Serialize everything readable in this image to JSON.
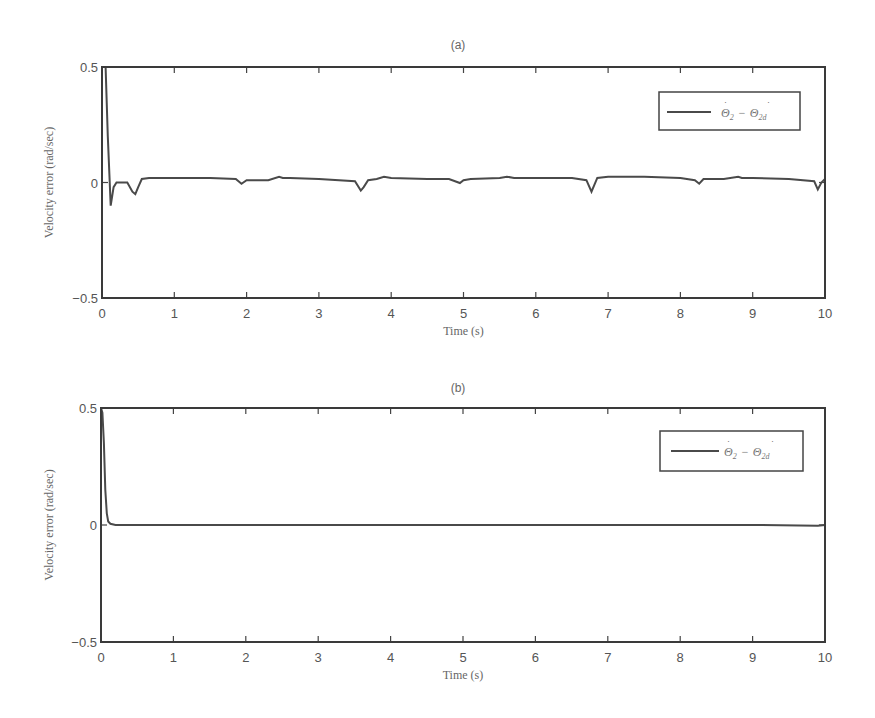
{
  "chart_data": [
    {
      "type": "line",
      "title": "(a)",
      "xlabel": "Time (s)",
      "ylabel": "Velocity error (rad/sec)",
      "xlim": [
        0,
        10
      ],
      "ylim": [
        -0.5,
        0.5
      ],
      "xticks": [
        "0",
        "1",
        "2",
        "3",
        "4",
        "5",
        "6",
        "7",
        "8",
        "9",
        "10"
      ],
      "yticks": [
        "0.5",
        "0",
        "-0.5"
      ],
      "grid": false,
      "legend": {
        "position": "upper right",
        "entries": [
          "Θ̇2 − Θ̇2d"
        ]
      },
      "series": [
        {
          "name": "Θ̇2 − Θ̇2d",
          "x": [
            0,
            0.02,
            0.05,
            0.08,
            0.12,
            0.16,
            0.2,
            0.25,
            0.35,
            0.42,
            0.46,
            0.5,
            0.55,
            0.65,
            1.0,
            1.5,
            1.85,
            1.93,
            2.0,
            2.3,
            2.45,
            2.5,
            2.6,
            3.0,
            3.5,
            3.58,
            3.62,
            3.68,
            3.8,
            3.9,
            4.0,
            4.5,
            4.8,
            4.95,
            5.0,
            5.1,
            5.5,
            5.6,
            5.7,
            6.0,
            6.5,
            6.7,
            6.77,
            6.85,
            7.0,
            7.5,
            8.0,
            8.2,
            8.26,
            8.32,
            8.6,
            8.8,
            8.85,
            9.0,
            9.5,
            9.85,
            9.9,
            9.95,
            10.0
          ],
          "values": [
            0.5,
            0.5,
            0.5,
            0.2,
            -0.1,
            -0.02,
            0.0,
            0.0,
            0.0,
            -0.04,
            -0.05,
            -0.02,
            0.015,
            0.02,
            0.02,
            0.02,
            0.015,
            -0.005,
            0.01,
            0.01,
            0.025,
            0.02,
            0.02,
            0.015,
            0.005,
            -0.035,
            -0.02,
            0.01,
            0.015,
            0.025,
            0.02,
            0.015,
            0.015,
            -0.002,
            0.01,
            0.015,
            0.02,
            0.025,
            0.02,
            0.02,
            0.02,
            0.01,
            -0.04,
            0.02,
            0.025,
            0.025,
            0.02,
            0.01,
            -0.005,
            0.015,
            0.015,
            0.025,
            0.02,
            0.02,
            0.015,
            0.005,
            -0.03,
            0.0,
            0.015
          ]
        }
      ]
    },
    {
      "type": "line",
      "title": "(b)",
      "xlabel": "Time (s)",
      "ylabel": "Velocity error (rad/sec)",
      "xlim": [
        0,
        10
      ],
      "ylim": [
        -0.5,
        0.5
      ],
      "xticks": [
        "0",
        "1",
        "2",
        "3",
        "4",
        "5",
        "6",
        "7",
        "8",
        "9",
        "10"
      ],
      "yticks": [
        "0.5",
        "0",
        "-0.5"
      ],
      "grid": false,
      "legend": {
        "position": "upper right",
        "entries": [
          "Θ̇2 − Θ̇2d"
        ]
      },
      "series": [
        {
          "name": "Θ̇2 − Θ̇2d",
          "x": [
            0,
            0.02,
            0.04,
            0.06,
            0.08,
            0.1,
            0.13,
            0.2,
            1.0,
            2.0,
            3.0,
            4.0,
            5.0,
            6.0,
            7.0,
            8.0,
            9.0,
            9.9,
            10.0
          ],
          "values": [
            0.5,
            0.48,
            0.35,
            0.15,
            0.05,
            0.015,
            0.005,
            0.0,
            0.0,
            0.0,
            0.0,
            0.0,
            0.0,
            0.0,
            0.0,
            0.0,
            0.0,
            -0.003,
            0.0
          ]
        }
      ]
    }
  ],
  "panels": [
    {
      "title": "(a)",
      "xlabel": "Time (s)",
      "ylabel": "Velocity error (rad/sec)",
      "legend_main": "Θ",
      "legend_sub1": "2",
      "legend_minus": "−",
      "legend_sub2": "2d"
    },
    {
      "title": "(b)",
      "xlabel": "Time (s)",
      "ylabel": "Velocity error (rad/sec)",
      "legend_main": "Θ",
      "legend_sub1": "2",
      "legend_minus": "−",
      "legend_sub2": "2d"
    }
  ],
  "style": {
    "line_color": "#4a4a4a",
    "axis_color": "#3a3a3a",
    "text_color": "#555555"
  }
}
